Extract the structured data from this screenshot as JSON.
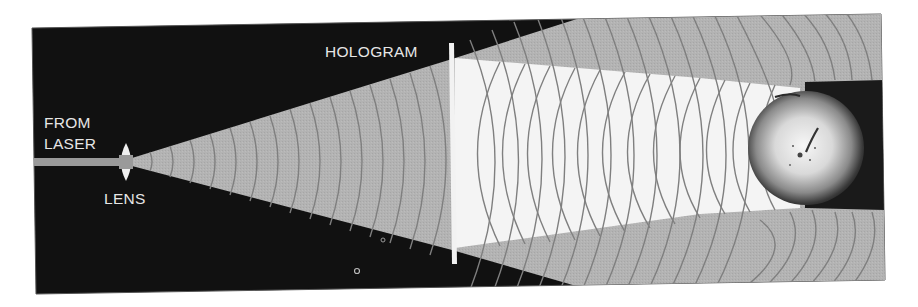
{
  "diagram": {
    "labels": {
      "from_laser_line1": "FROM",
      "from_laser_line2": "LASER",
      "lens": "LENS",
      "hologram": "HOLOGRAM"
    },
    "colors": {
      "background_panel": "#111111",
      "page": "#ffffff",
      "reference_beam": "#b3b3b3",
      "object_beam": "#f4f4f4",
      "wavefront_line": "#7f7f7f",
      "hologram_plate": "#f2f2f2",
      "shadow": "#1a1a1a",
      "label_text": "#e6e6e6"
    },
    "elements": [
      "laser-beam",
      "lens",
      "diverging-reference-beam",
      "hologram-plate",
      "object-beam",
      "apple-object",
      "apple-shadow"
    ]
  }
}
